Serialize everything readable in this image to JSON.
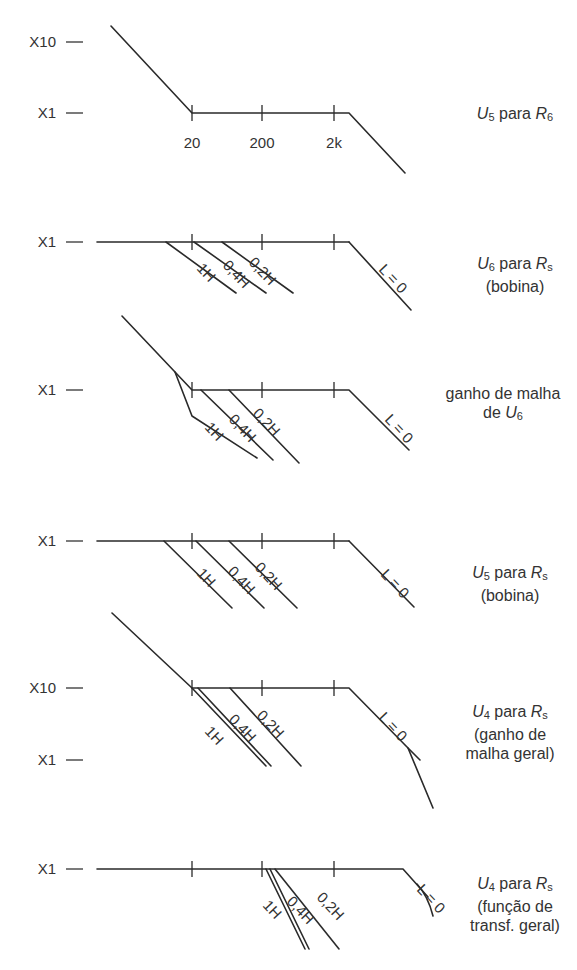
{
  "diagram": {
    "stroke_color": "#2a2a2a",
    "text_color": "#333333",
    "tick_x": [
      192,
      262,
      334
    ],
    "frequency_labels": [
      "20",
      "200",
      "2k"
    ],
    "panels": [
      {
        "id": "u5-r6",
        "y_labels": [
          {
            "text": "X10",
            "y": 42
          },
          {
            "text": "X1",
            "y": 113
          }
        ],
        "baseline_y": 113,
        "caption_lines": [
          {
            "parts": [
              {
                "t": "U",
                "i": true
              },
              {
                "t": "5",
                "sub": true
              },
              {
                "t": " para "
              },
              {
                "t": "R",
                "i": true
              },
              {
                "t": "6",
                "sub": true
              }
            ]
          }
        ],
        "caption_pos": {
          "x": 460,
          "y": 104
        },
        "paths": [
          "M111,26 L192,113 L349,113 L405,173"
        ],
        "slope_labels": [],
        "show_freq_labels": true
      },
      {
        "id": "u6-rs",
        "y_labels": [
          {
            "text": "X1",
            "y": 242
          }
        ],
        "baseline_y": 242,
        "caption_lines": [
          {
            "parts": [
              {
                "t": "U",
                "i": true
              },
              {
                "t": "6",
                "sub": true
              },
              {
                "t": " para "
              },
              {
                "t": "R",
                "i": true
              },
              {
                "t": "s",
                "sub": true
              }
            ]
          },
          {
            "parts": [
              {
                "t": "(bobina)"
              }
            ]
          }
        ],
        "caption_pos": {
          "x": 460,
          "y": 254
        },
        "paths": [
          "M97,242 L349,242",
          "M166,242 L236,293",
          "M194,242 L266,293",
          "M222,242 L293,293",
          "M349,242 L411,310"
        ],
        "slope_labels": [
          {
            "text": "1H",
            "x": 196,
            "y": 269
          },
          {
            "text": "0,4H",
            "x": 222,
            "y": 266
          },
          {
            "text": "0,2H",
            "x": 248,
            "y": 263
          },
          {
            "text": "L = 0",
            "x": 378,
            "y": 270
          }
        ],
        "show_freq_labels": false
      },
      {
        "id": "loop-gain-u6",
        "y_labels": [
          {
            "text": "X1",
            "y": 390
          }
        ],
        "baseline_y": 390,
        "caption_lines": [
          {
            "parts": [
              {
                "t": "ganho de malha"
              }
            ]
          },
          {
            "parts": [
              {
                "t": "de "
              },
              {
                "t": "U",
                "i": true
              },
              {
                "t": "6",
                "sub": true
              }
            ]
          }
        ],
        "caption_pos": {
          "x": 448,
          "y": 384
        },
        "paths": [
          "M122,316 L175,372 L192,390 L349,390 L409,450",
          "M175,372 L192,416 L257,458",
          "M201,390 L273,460",
          "M229,390 L299,463"
        ],
        "slope_labels": [
          {
            "text": "1H",
            "x": 204,
            "y": 428
          },
          {
            "text": "0,4H",
            "x": 228,
            "y": 420
          },
          {
            "text": "0,2H",
            "x": 252,
            "y": 414
          },
          {
            "text": "L = 0",
            "x": 384,
            "y": 420
          }
        ],
        "show_freq_labels": false
      },
      {
        "id": "u5-rs",
        "y_labels": [
          {
            "text": "X1",
            "y": 541
          }
        ],
        "baseline_y": 541,
        "caption_lines": [
          {
            "parts": [
              {
                "t": "U",
                "i": true
              },
              {
                "t": "5",
                "sub": true
              },
              {
                "t": " para "
              },
              {
                "t": "R",
                "i": true
              },
              {
                "t": "s",
                "sub": true
              }
            ]
          },
          {
            "parts": [
              {
                "t": "(bobina)"
              }
            ]
          }
        ],
        "caption_pos": {
          "x": 455,
          "y": 563
        },
        "paths": [
          "M97,541 L349,541",
          "M164,541 L232,608",
          "M196,541 L264,608",
          "M229,541 L297,608",
          "M349,541 L414,607"
        ],
        "slope_labels": [
          {
            "text": "1H",
            "x": 196,
            "y": 574
          },
          {
            "text": "0,4H",
            "x": 227,
            "y": 572
          },
          {
            "text": "0,2H",
            "x": 254,
            "y": 568
          },
          {
            "text": "L = 0",
            "x": 380,
            "y": 575
          }
        ],
        "show_freq_labels": false
      },
      {
        "id": "u4-rs-loop",
        "y_labels": [
          {
            "text": "X10",
            "y": 688
          },
          {
            "text": "X1",
            "y": 760
          }
        ],
        "baseline_y": 688,
        "caption_lines": [
          {
            "parts": [
              {
                "t": "U",
                "i": true
              },
              {
                "t": "4",
                "sub": true
              },
              {
                "t": " para "
              },
              {
                "t": "R",
                "i": true
              },
              {
                "t": "s",
                "sub": true
              }
            ]
          },
          {
            "parts": [
              {
                "t": "(ganho de"
              }
            ]
          },
          {
            "parts": [
              {
                "t": "malha geral)"
              }
            ]
          }
        ],
        "caption_pos": {
          "x": 455,
          "y": 702
        },
        "paths": [
          "M112,613 L192,688 L349,688 L408,748 L420,760",
          "M408,748 L433,808",
          "M192,688 L266,766",
          "M198,688 L271,766",
          "M230,688 L301,766"
        ],
        "slope_labels": [
          {
            "text": "1H",
            "x": 204,
            "y": 732
          },
          {
            "text": "0,4H",
            "x": 228,
            "y": 720
          },
          {
            "text": "0,2H",
            "x": 256,
            "y": 716
          },
          {
            "text": "L = 0",
            "x": 378,
            "y": 718
          }
        ],
        "show_freq_labels": false
      },
      {
        "id": "u4-rs-transfer",
        "y_labels": [
          {
            "text": "X1",
            "y": 869
          }
        ],
        "baseline_y": 869,
        "caption_lines": [
          {
            "parts": [
              {
                "t": "U",
                "i": true
              },
              {
                "t": "4",
                "sub": true
              },
              {
                "t": " para "
              },
              {
                "t": "R",
                "i": true
              },
              {
                "t": "s",
                "sub": true
              }
            ]
          },
          {
            "parts": [
              {
                "t": "(função de"
              }
            ]
          },
          {
            "parts": [
              {
                "t": "transf. geral)"
              }
            ]
          }
        ],
        "caption_pos": {
          "x": 460,
          "y": 874
        },
        "paths": [
          "M97,869 L403,869 L428,897",
          "M417,884 Q428,896 433,916",
          "M266,869 L305,949",
          "M270,869 L309,949",
          "M275,869 L339,949"
        ],
        "slope_labels": [
          {
            "text": "1H",
            "x": 262,
            "y": 906
          },
          {
            "text": "0,4H",
            "x": 286,
            "y": 902
          },
          {
            "text": "0,2H",
            "x": 316,
            "y": 898
          },
          {
            "text": "L = 0",
            "x": 416,
            "y": 890
          }
        ],
        "show_freq_labels": false
      }
    ]
  }
}
